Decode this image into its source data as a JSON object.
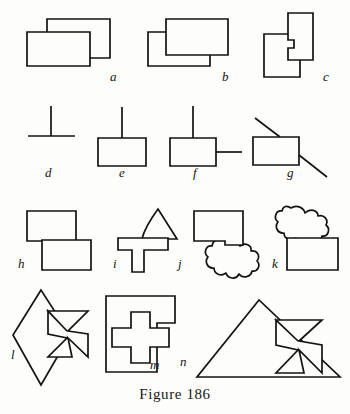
{
  "figure": {
    "caption": "Figure 186",
    "background_color": "#fdfdfb",
    "ink_color": "#15130f",
    "panels": [
      {
        "key": "a",
        "label": "a",
        "label_x": 110,
        "label_y": 73,
        "description": "two overlapping rectangles, lower-left rectangle in front"
      },
      {
        "key": "b",
        "label": "b",
        "label_x": 222,
        "label_y": 73,
        "description": "two overlapping rectangles, upper-right rectangle in front"
      },
      {
        "key": "c",
        "label": "c",
        "label_x": 324,
        "label_y": 73,
        "description": "two overlapping vertical rectangles, right one in front with notch"
      },
      {
        "key": "d",
        "label": "d",
        "label_x": 44,
        "label_y": 168,
        "description": "inverted T formed by a vertical stroke meeting a horizontal stroke"
      },
      {
        "key": "e",
        "label": "e",
        "label_x": 118,
        "label_y": 168,
        "description": "rectangle with a vertical line rising from its top edge"
      },
      {
        "key": "f",
        "label": "f",
        "label_x": 194,
        "label_y": 168,
        "description": "rectangle with a vertical line on top and a horizontal line at the right"
      },
      {
        "key": "g",
        "label": "g",
        "label_x": 288,
        "label_y": 168,
        "description": "rectangle crossed by a diagonal line entering top and leaving bottom-right"
      },
      {
        "key": "h",
        "label": "h",
        "label_x": 18,
        "label_y": 264,
        "description": "two rectangles overlapping corner to corner, lower one in front"
      },
      {
        "key": "i",
        "label": "i",
        "label_x": 113,
        "label_y": 264,
        "description": "T shape with a curved-sided triangle resting on its top bar"
      },
      {
        "key": "j",
        "label": "j",
        "label_x": 0,
        "label_y": 0,
        "description": "rectangle with an amoeba blob attached at its lower-right corner"
      },
      {
        "key": "k",
        "label": "k",
        "label_x": 266,
        "label_y": 264,
        "description": "rectangle with an amoeba blob attached at its upper-left corner"
      },
      {
        "key": "l",
        "label": "l",
        "label_x": 12,
        "label_y": 352,
        "description": "diamond overlapping a Maltese cross"
      },
      {
        "key": "m",
        "label": "m",
        "label_x": 150,
        "label_y": 366,
        "description": "plus/cross shape overlapping a square"
      },
      {
        "key": "n",
        "label": "n",
        "label_x": 180,
        "label_y": 362,
        "description": "triangle overlapping a Maltese cross"
      }
    ]
  }
}
